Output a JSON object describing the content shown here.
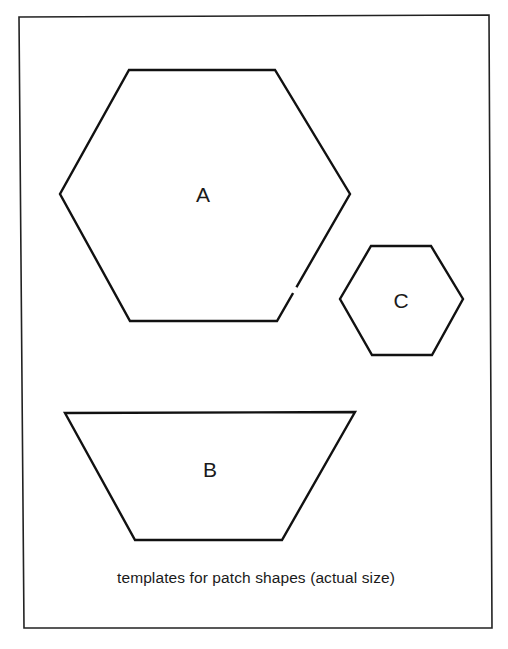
{
  "figure": {
    "caption": "templates for patch shapes (actual size)",
    "colors": {
      "background": "#ffffff",
      "stroke": "#111111",
      "text": "#1a1a1a"
    },
    "shapes": [
      {
        "id": "A",
        "label": "A",
        "type": "hexagon",
        "size": "large"
      },
      {
        "id": "B",
        "label": "B",
        "type": "trapezoid",
        "size": "wide"
      },
      {
        "id": "C",
        "label": "C",
        "type": "hexagon",
        "size": "small"
      }
    ]
  }
}
